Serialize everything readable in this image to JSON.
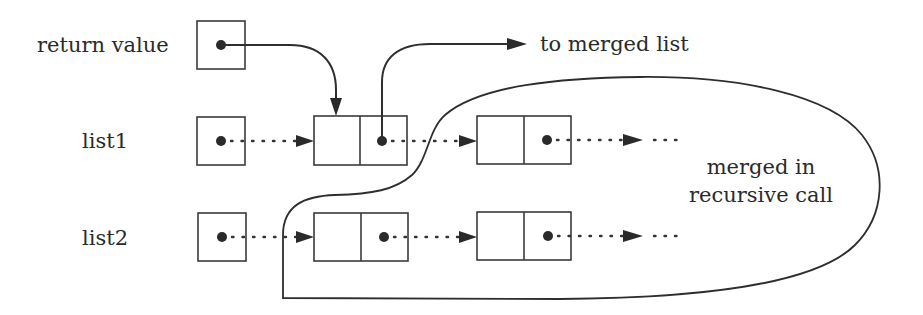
{
  "diagram": {
    "title": "",
    "labels": {
      "return_value": "return value",
      "list1": "list1",
      "list2": "list2",
      "to_merged_list": "to merged list",
      "loop_caption_line1": "merged in",
      "loop_caption_line2": "recursive call",
      "ellipsis_list1": "· · ·",
      "ellipsis_list2": "· · ·"
    },
    "nodes": [
      {
        "id": "return-value-pointer",
        "type": "pointer-cell",
        "x": 197,
        "y": 21,
        "w": 48,
        "h": 48
      },
      {
        "id": "list1-pointer",
        "type": "pointer-cell",
        "x": 197,
        "y": 117,
        "w": 48,
        "h": 48
      },
      {
        "id": "list2-pointer",
        "type": "pointer-cell",
        "x": 198,
        "y": 213,
        "w": 48,
        "h": 48
      },
      {
        "id": "list1-node-1",
        "type": "list-node",
        "x": 314,
        "y": 116,
        "w": 93,
        "h": 49
      },
      {
        "id": "list1-node-2",
        "type": "list-node",
        "x": 477,
        "y": 116,
        "w": 94,
        "h": 48
      },
      {
        "id": "list2-node-1",
        "type": "list-node",
        "x": 314,
        "y": 213,
        "w": 94,
        "h": 48
      },
      {
        "id": "list2-node-2",
        "type": "list-node",
        "x": 477,
        "y": 212,
        "w": 94,
        "h": 48
      }
    ],
    "edges": [
      {
        "from": "return-value-pointer",
        "to": "list1-node-1",
        "style": "solid"
      },
      {
        "from": "list1-node-1",
        "to": "to merged list",
        "style": "solid"
      },
      {
        "from": "list1-pointer",
        "to": "list1-node-1",
        "style": "dotted"
      },
      {
        "from": "list1-node-1",
        "to": "list1-node-2",
        "style": "dotted"
      },
      {
        "from": "list1-node-2",
        "to": "...",
        "style": "dotted"
      },
      {
        "from": "list2-pointer",
        "to": "list2-node-1",
        "style": "dotted"
      },
      {
        "from": "list2-node-1",
        "to": "list2-node-2",
        "style": "dotted"
      },
      {
        "from": "list2-node-2",
        "to": "...",
        "style": "dotted"
      }
    ],
    "colors": {
      "stroke": "#2e2e2e",
      "background": "#ffffff"
    }
  }
}
